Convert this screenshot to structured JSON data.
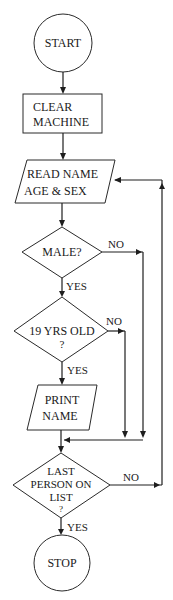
{
  "diagram": {
    "type": "flowchart",
    "nodes": {
      "start": {
        "shape": "terminal-circle",
        "label": "START"
      },
      "clear": {
        "shape": "process-rect",
        "line1": "CLEAR",
        "line2": "MACHINE"
      },
      "read": {
        "shape": "io-parallelogram",
        "line1": "READ NAME",
        "line2": "AGE & SEX"
      },
      "male": {
        "shape": "decision-diamond",
        "label": "MALE?"
      },
      "age": {
        "shape": "decision-diamond",
        "line1": "19 YRS OLD",
        "line2": "?"
      },
      "print": {
        "shape": "io-parallelogram",
        "line1": "PRINT",
        "line2": "NAME"
      },
      "last": {
        "shape": "decision-diamond",
        "line1": "LAST",
        "line2": "PERSON ON",
        "line3": "LIST",
        "line4": "?"
      },
      "stop": {
        "shape": "terminal-circle",
        "label": "STOP"
      }
    },
    "edge_labels": {
      "male_no": "NO",
      "male_yes": "YES",
      "age_no": "NO",
      "age_yes": "YES",
      "last_no": "NO",
      "last_yes": "YES"
    },
    "edges": [
      {
        "from": "start",
        "to": "clear"
      },
      {
        "from": "clear",
        "to": "read"
      },
      {
        "from": "read",
        "to": "male"
      },
      {
        "from": "male",
        "to": "age",
        "label": "YES"
      },
      {
        "from": "male",
        "to": "merge",
        "label": "NO"
      },
      {
        "from": "age",
        "to": "print",
        "label": "YES"
      },
      {
        "from": "age",
        "to": "merge",
        "label": "NO"
      },
      {
        "from": "print",
        "to": "last"
      },
      {
        "from": "last",
        "to": "stop",
        "label": "YES"
      },
      {
        "from": "last",
        "to": "read",
        "label": "NO"
      }
    ]
  }
}
